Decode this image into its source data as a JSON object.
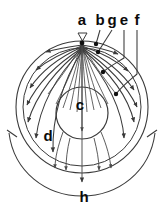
{
  "figure": {
    "type": "anatomical-flow-diagram",
    "title": "",
    "background_color": "#ffffff",
    "stroke_color": "#3a3a3a",
    "label_color": "#0b0b0b"
  },
  "labels": {
    "a": "a",
    "b": "b",
    "g": "g",
    "e": "e",
    "f": "f",
    "c": "c",
    "d": "d",
    "h": "h"
  },
  "label_positions": {
    "a": {
      "x": 82,
      "y": 25,
      "role": "apex-marker-label"
    },
    "b": {
      "x": 100,
      "y": 25,
      "role": "leader-line-label"
    },
    "g": {
      "x": 112,
      "y": 25,
      "role": "leader-line-label"
    },
    "e": {
      "x": 124,
      "y": 25,
      "role": "leader-line-label"
    },
    "f": {
      "x": 137,
      "y": 25,
      "role": "leader-line-label"
    },
    "c": {
      "x": 80,
      "y": 106,
      "role": "inner-region-label"
    },
    "d": {
      "x": 48,
      "y": 135,
      "role": "outer-region-label"
    },
    "h": {
      "x": 84,
      "y": 197,
      "role": "bracket-span-label"
    }
  },
  "geometry": {
    "outer_circle": {
      "cx": 82,
      "cy": 107,
      "r": 66
    },
    "second_circle": {
      "cx": 82,
      "cy": 107,
      "r": 60
    },
    "inner_circle": {
      "cx": 82,
      "cy": 113,
      "r": 26
    },
    "apex": {
      "x": 82,
      "y": 43
    },
    "bracket_arc": {
      "cx": 82,
      "cy": 107,
      "r": 78,
      "start_deg": 160,
      "end_deg": 20
    }
  },
  "elements": {
    "apex_marker": "down-triangle-marker",
    "fan_lines": "radiating-fan-from-apex",
    "flow_arrows": "curved-arrows-outward",
    "center_axis": "vertical-midline-arrow",
    "span_bracket": "bottom-span-bracket"
  }
}
